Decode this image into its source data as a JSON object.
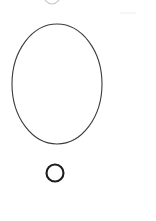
{
  "figure": {
    "title": "Hand-drawn outline shapes on white background",
    "background_color": "#ffffff",
    "width": 156,
    "height": 221,
    "shapes": [
      {
        "id": "large-ellipse",
        "name": "large-ellipse",
        "type": "ellipse",
        "cx": 57,
        "cy": 84,
        "rx": 45,
        "ry": 60,
        "stroke": "#3a3a40",
        "stroke_width": 1.1,
        "fill": "none",
        "label": "Large ellipse outline"
      },
      {
        "id": "small-circle",
        "name": "small-circle",
        "type": "circle",
        "cx": 55,
        "cy": 173,
        "r": 8.5,
        "stroke": "#1c1c1c",
        "stroke_width": 2.1,
        "fill": "none",
        "label": "Small circle outline"
      },
      {
        "id": "top-clipped-arc",
        "name": "top-clipped-arc",
        "type": "arc",
        "cx": 52,
        "cy": -5,
        "rx": 8,
        "ry": 9,
        "stroke": "#c9c9cc",
        "stroke_width": 1.2,
        "fill": "none",
        "label": "Faint clipped circle arc at top edge"
      },
      {
        "id": "faint-mark-right",
        "name": "faint-mark-right",
        "type": "line",
        "x1": 120,
        "y1": 13,
        "x2": 136,
        "y2": 13,
        "stroke": "#ededef",
        "stroke_width": 1,
        "label": "Faint horizontal smudge mark"
      }
    ]
  },
  "chart_data": {
    "type": "scatter",
    "xlabel": "",
    "ylabel": "",
    "xlim": [
      0,
      156
    ],
    "ylim": [
      0,
      221
    ],
    "grid": false,
    "legend": "none",
    "annotations": [
      "large ellipse centered near (57, 84), width 90 px, height 120 px",
      "small circle centered near (55, 173), diameter 17 px",
      "faint partial circle clipped by top edge near x = 52"
    ],
    "series": [
      {
        "name": "large-ellipse",
        "cx": 57,
        "cy": 84,
        "rx": 45,
        "ry": 60
      },
      {
        "name": "small-circle",
        "cx": 55,
        "cy": 173,
        "rx": 8.5,
        "ry": 8.5
      },
      {
        "name": "top-clipped-arc",
        "cx": 52,
        "cy": -5,
        "rx": 8,
        "ry": 9
      }
    ]
  }
}
